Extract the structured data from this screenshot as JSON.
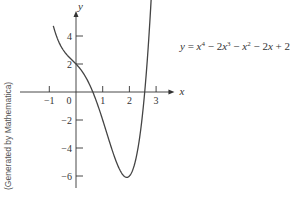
{
  "chart_data": {
    "type": "line",
    "title": "",
    "xlabel": "x",
    "ylabel": "y",
    "function_label": "y = x^4 − 2x^3 − x^2 − 2x + 2",
    "x_ticks": [
      -1,
      0,
      1,
      2,
      3
    ],
    "x_tick_labels": [
      "−1",
      "0",
      "1",
      "2",
      "3"
    ],
    "y_ticks": [
      4,
      2,
      -2,
      -4,
      -6
    ],
    "y_tick_labels": [
      "4",
      "2",
      "−2",
      "−4",
      "−6"
    ],
    "xlim": [
      -1.3,
      3.3
    ],
    "ylim": [
      -6.5,
      5.6
    ],
    "grid": false,
    "series": [
      {
        "name": "y = x^4 − 2x^3 − x^2 − 2x + 2",
        "x": [
          -0.85,
          -0.5,
          0,
          0.5,
          0.76,
          1,
          1.5,
          1.8,
          2,
          2.5,
          2.93
        ],
        "y": [
          4.73,
          3.31,
          2.0,
          0.56,
          0.0,
          -2.0,
          -4.94,
          -5.96,
          -6.0,
          -1.72,
          5.1
        ]
      }
    ],
    "annotations": [
      "(Generated by Mathematica)"
    ]
  },
  "equation": {
    "lhs": "y",
    "eq": " = ",
    "t1": "x",
    "t1_exp": "4",
    "t2_op": " − 2",
    "t2": "x",
    "t2_exp": "3",
    "t3_op": " − ",
    "t3": "x",
    "t3_exp": "2",
    "t4_op": " − 2",
    "t4": "x",
    "t5": " + 2"
  },
  "credit": "(Generated by Mathematica)",
  "colors": {
    "axis": "#333333",
    "curve": "#444444"
  }
}
